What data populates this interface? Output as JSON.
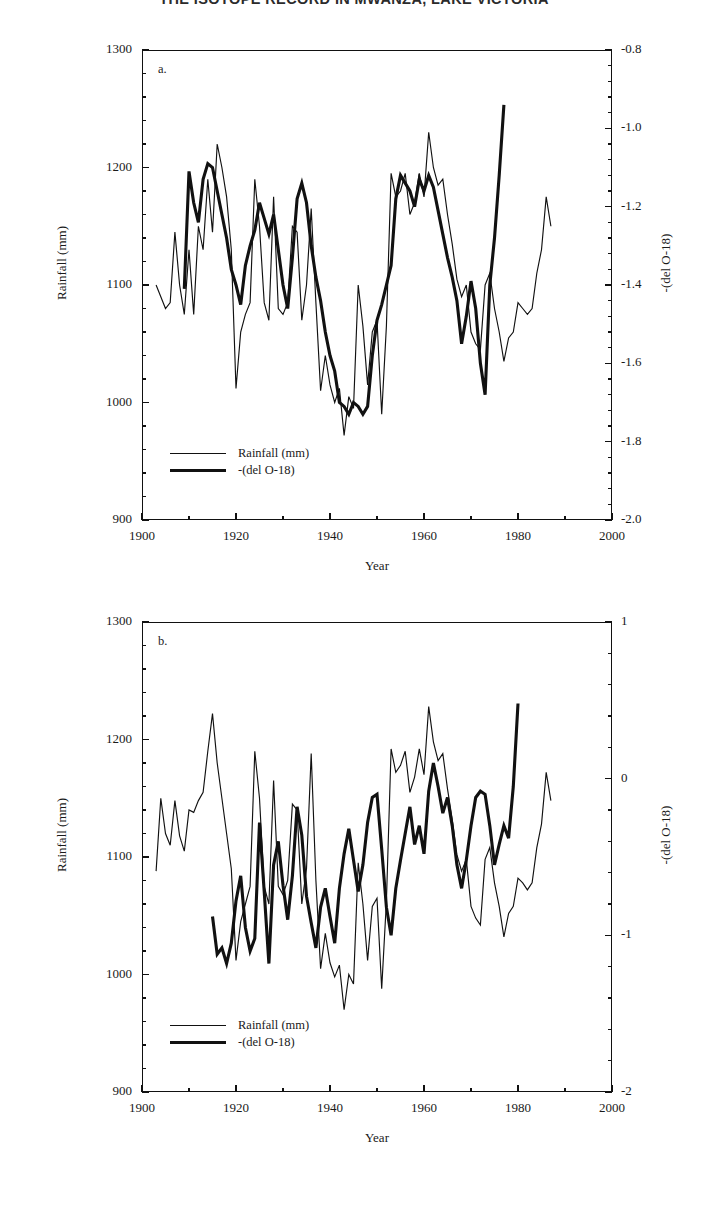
{
  "figure": {
    "title": "THE ISOTOPE RECORD IN MWANZA, LAKE VICTORIA"
  },
  "panels": [
    {
      "id": "a",
      "letter": "a.",
      "y_left_title": "Rainfall (mm)",
      "y_right_title": "-(del O-18)",
      "x_title": "Year",
      "y_left_ticks": [
        "900",
        "1000",
        "1100",
        "1200",
        "1300"
      ],
      "y_right_ticks": [
        "-2.0",
        "-1.8",
        "-1.6",
        "-1.4",
        "-1.2",
        "-1.0",
        "-0.8"
      ],
      "x_ticks": [
        "1900",
        "1920",
        "1940",
        "1960",
        "1980",
        "2000"
      ],
      "legend": [
        {
          "label": "Rainfall (mm)",
          "style": "thin"
        },
        {
          "label": "-(del O-18)",
          "style": "thick"
        }
      ]
    },
    {
      "id": "b",
      "letter": "b.",
      "y_left_title": "Rainfall (mm)",
      "y_right_title": "-(del O-18)",
      "x_title": "Year",
      "y_left_ticks": [
        "900",
        "1000",
        "1100",
        "1200",
        "1300"
      ],
      "y_right_ticks": [
        "-2",
        "-1",
        "0",
        "1"
      ],
      "x_ticks": [
        "1900",
        "1920",
        "1940",
        "1960",
        "1980",
        "2000"
      ],
      "legend": [
        {
          "label": "Rainfall (mm)",
          "style": "thin"
        },
        {
          "label": "-(del O-18)",
          "style": "thick"
        }
      ]
    }
  ],
  "chart_data": [
    {
      "type": "line",
      "panel": "a",
      "title": "THE ISOTOPE RECORD IN MWANZA, LAKE VICTORIA",
      "xlabel": "Year",
      "ylabel": "Rainfall (mm)",
      "ylabel_right": "-(del O-18)",
      "xlim": [
        1900,
        2000
      ],
      "ylim": [
        900,
        1300
      ],
      "ylim_right": [
        -2.0,
        -0.8
      ],
      "grid": false,
      "legend_position": "lower-left",
      "xticks": [
        1900,
        1920,
        1940,
        1960,
        1980,
        2000
      ],
      "yticks": [
        900,
        1000,
        1100,
        1200,
        1300
      ],
      "yticks_right": [
        -2.0,
        -1.8,
        -1.6,
        -1.4,
        -1.2,
        -1.0,
        -0.8
      ],
      "minor_tick_interval_x": 10,
      "minor_tick_interval_y": 20,
      "series": [
        {
          "name": "Rainfall (mm)",
          "axis": "left",
          "style": "thin",
          "x": [
            1903,
            1904,
            1905,
            1906,
            1907,
            1908,
            1909,
            1910,
            1911,
            1912,
            1913,
            1914,
            1915,
            1916,
            1917,
            1918,
            1919,
            1920,
            1921,
            1922,
            1923,
            1924,
            1925,
            1926,
            1927,
            1928,
            1929,
            1930,
            1931,
            1932,
            1933,
            1934,
            1935,
            1936,
            1937,
            1938,
            1939,
            1940,
            1941,
            1942,
            1943,
            1944,
            1945,
            1946,
            1947,
            1948,
            1949,
            1950,
            1951,
            1952,
            1953,
            1954,
            1955,
            1956,
            1957,
            1958,
            1959,
            1960,
            1961,
            1962,
            1963,
            1964,
            1965,
            1966,
            1967,
            1968,
            1969,
            1970,
            1971,
            1972,
            1973,
            1974,
            1975,
            1976,
            1977,
            1978,
            1979,
            1980,
            1981,
            1982,
            1983,
            1984,
            1985,
            1986,
            1987,
            1988
          ],
          "y": [
            1100,
            1090,
            1080,
            1085,
            1145,
            1100,
            1075,
            1130,
            1075,
            1150,
            1130,
            1190,
            1145,
            1220,
            1200,
            1175,
            1130,
            1012,
            1060,
            1075,
            1085,
            1190,
            1150,
            1085,
            1070,
            1175,
            1080,
            1075,
            1085,
            1150,
            1145,
            1070,
            1100,
            1165,
            1085,
            1010,
            1040,
            1015,
            1000,
            1012,
            972,
            1005,
            995,
            1100,
            1065,
            1015,
            1060,
            1070,
            990,
            1065,
            1195,
            1175,
            1180,
            1195,
            1160,
            1170,
            1195,
            1175,
            1230,
            1200,
            1185,
            1190,
            1160,
            1135,
            1105,
            1090,
            1100,
            1060,
            1050,
            1045,
            1100,
            1110,
            1080,
            1060,
            1035,
            1055,
            1060,
            1085,
            1080,
            1075,
            1080,
            1110,
            1130,
            1175,
            1150
          ]
        },
        {
          "name": "-(del O-18)",
          "axis": "right",
          "style": "thick",
          "x": [
            1909,
            1910,
            1911,
            1912,
            1913,
            1914,
            1915,
            1916,
            1917,
            1918,
            1919,
            1920,
            1921,
            1922,
            1923,
            1924,
            1925,
            1926,
            1927,
            1928,
            1929,
            1930,
            1931,
            1932,
            1933,
            1934,
            1935,
            1936,
            1937,
            1938,
            1939,
            1940,
            1941,
            1942,
            1943,
            1944,
            1945,
            1946,
            1947,
            1948,
            1949,
            1950,
            1951,
            1952,
            1953,
            1954,
            1955,
            1956,
            1957,
            1958,
            1959,
            1960,
            1961,
            1962,
            1963,
            1964,
            1965,
            1966,
            1967,
            1968,
            1969,
            1970,
            1971,
            1972,
            1973,
            1974,
            1975,
            1976,
            1977
          ],
          "y_right": [
            -1.41,
            -1.11,
            -1.19,
            -1.24,
            -1.13,
            -1.09,
            -1.1,
            -1.16,
            -1.22,
            -1.28,
            -1.36,
            -1.4,
            -1.45,
            -1.35,
            -1.3,
            -1.26,
            -1.19,
            -1.23,
            -1.27,
            -1.22,
            -1.31,
            -1.4,
            -1.46,
            -1.33,
            -1.18,
            -1.14,
            -1.19,
            -1.3,
            -1.38,
            -1.44,
            -1.52,
            -1.58,
            -1.62,
            -1.7,
            -1.71,
            -1.73,
            -1.7,
            -1.71,
            -1.73,
            -1.71,
            -1.58,
            -1.49,
            -1.45,
            -1.4,
            -1.35,
            -1.18,
            -1.12,
            -1.14,
            -1.16,
            -1.2,
            -1.13,
            -1.16,
            -1.12,
            -1.15,
            -1.21,
            -1.27,
            -1.33,
            -1.38,
            -1.44,
            -1.55,
            -1.48,
            -1.39,
            -1.46,
            -1.6,
            -1.68,
            -1.4,
            -1.28,
            -1.12,
            -0.94
          ]
        }
      ]
    },
    {
      "type": "line",
      "panel": "b",
      "xlabel": "Year",
      "ylabel": "Rainfall (mm)",
      "ylabel_right": "-(del O-18)",
      "xlim": [
        1900,
        2000
      ],
      "ylim": [
        900,
        1300
      ],
      "ylim_right": [
        -2,
        1
      ],
      "grid": false,
      "legend_position": "lower-left",
      "xticks": [
        1900,
        1920,
        1940,
        1960,
        1980,
        2000
      ],
      "yticks": [
        900,
        1000,
        1100,
        1200,
        1300
      ],
      "yticks_right": [
        -2,
        -1,
        0,
        1
      ],
      "minor_tick_interval_x": 10,
      "minor_tick_interval_y": 20,
      "series": [
        {
          "name": "Rainfall (mm)",
          "axis": "left",
          "style": "thin",
          "x": [
            1903,
            1904,
            1905,
            1906,
            1907,
            1908,
            1909,
            1910,
            1911,
            1912,
            1913,
            1914,
            1915,
            1916,
            1917,
            1918,
            1919,
            1920,
            1921,
            1922,
            1923,
            1924,
            1925,
            1926,
            1927,
            1928,
            1929,
            1930,
            1931,
            1932,
            1933,
            1934,
            1935,
            1936,
            1937,
            1938,
            1939,
            1940,
            1941,
            1942,
            1943,
            1944,
            1945,
            1946,
            1947,
            1948,
            1949,
            1950,
            1951,
            1952,
            1953,
            1954,
            1955,
            1956,
            1957,
            1958,
            1959,
            1960,
            1961,
            1962,
            1963,
            1964,
            1965,
            1966,
            1967,
            1968,
            1969,
            1970,
            1971,
            1972,
            1973,
            1974,
            1975,
            1976,
            1977,
            1978,
            1979,
            1980,
            1981,
            1982,
            1983,
            1984,
            1985,
            1986,
            1987,
            1988
          ],
          "y": [
            1088,
            1150,
            1120,
            1110,
            1148,
            1118,
            1105,
            1140,
            1138,
            1148,
            1155,
            1190,
            1222,
            1180,
            1150,
            1120,
            1090,
            1012,
            1045,
            1060,
            1075,
            1190,
            1150,
            1075,
            1060,
            1165,
            1075,
            1068,
            1080,
            1145,
            1140,
            1060,
            1090,
            1188,
            1080,
            1005,
            1035,
            1010,
            998,
            1008,
            970,
            1000,
            992,
            1095,
            1060,
            1012,
            1058,
            1065,
            988,
            1062,
            1192,
            1172,
            1178,
            1190,
            1155,
            1168,
            1192,
            1170,
            1228,
            1198,
            1182,
            1188,
            1158,
            1132,
            1102,
            1088,
            1098,
            1058,
            1048,
            1042,
            1098,
            1108,
            1078,
            1058,
            1032,
            1052,
            1058,
            1082,
            1078,
            1072,
            1078,
            1108,
            1128,
            1172,
            1148
          ]
        },
        {
          "name": "-(del O-18)",
          "axis": "right",
          "style": "thick",
          "x": [
            1915,
            1916,
            1917,
            1918,
            1919,
            1920,
            1921,
            1922,
            1923,
            1924,
            1925,
            1926,
            1927,
            1928,
            1929,
            1930,
            1931,
            1932,
            1933,
            1934,
            1935,
            1936,
            1937,
            1938,
            1939,
            1940,
            1941,
            1942,
            1943,
            1944,
            1945,
            1946,
            1947,
            1948,
            1949,
            1950,
            1951,
            1952,
            1953,
            1954,
            1955,
            1956,
            1957,
            1958,
            1959,
            1960,
            1961,
            1962,
            1963,
            1964,
            1965,
            1966,
            1967,
            1968,
            1969,
            1970,
            1971,
            1972,
            1973,
            1974,
            1975,
            1976,
            1977,
            1978,
            1979,
            1980
          ],
          "y_right": [
            -0.88,
            -1.12,
            -1.08,
            -1.18,
            -1.05,
            -0.78,
            -0.62,
            -0.95,
            -1.1,
            -1.02,
            -0.28,
            -0.72,
            -1.18,
            -0.55,
            -0.4,
            -0.68,
            -0.9,
            -0.62,
            -0.18,
            -0.36,
            -0.75,
            -0.92,
            -1.08,
            -0.82,
            -0.7,
            -0.88,
            -1.05,
            -0.7,
            -0.48,
            -0.32,
            -0.52,
            -0.72,
            -0.55,
            -0.28,
            -0.12,
            -0.1,
            -0.45,
            -0.82,
            -1.0,
            -0.7,
            -0.52,
            -0.35,
            -0.18,
            -0.42,
            -0.3,
            -0.48,
            -0.08,
            0.1,
            -0.05,
            -0.22,
            -0.12,
            -0.3,
            -0.55,
            -0.7,
            -0.52,
            -0.3,
            -0.12,
            -0.08,
            -0.1,
            -0.3,
            -0.55,
            -0.42,
            -0.3,
            -0.38,
            -0.05,
            0.48
          ]
        }
      ]
    }
  ]
}
